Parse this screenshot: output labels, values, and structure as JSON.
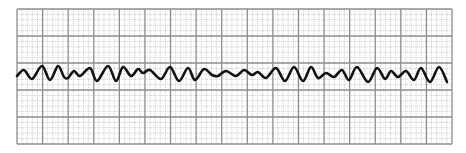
{
  "strip": {
    "type": "ecg-rhythm-strip",
    "background": "#ffffff",
    "grid": {
      "left": 17,
      "top": 9,
      "right": 452,
      "bottom": 144,
      "major_cols": 17,
      "major_rows": 5,
      "minor_per_major": 5,
      "major_color": "#8c8c8c",
      "minor_color": "#c8c8c8"
    },
    "trace": {
      "color": "#111111",
      "width": 2.6,
      "points": [
        [
          17,
          76
        ],
        [
          24,
          70
        ],
        [
          32,
          79
        ],
        [
          42,
          66
        ],
        [
          50,
          80
        ],
        [
          58,
          66
        ],
        [
          64,
          77
        ],
        [
          68,
          78
        ],
        [
          74,
          71
        ],
        [
          80,
          76
        ],
        [
          90,
          68
        ],
        [
          97,
          81
        ],
        [
          108,
          66
        ],
        [
          116,
          81
        ],
        [
          123,
          67
        ],
        [
          131,
          76
        ],
        [
          138,
          69
        ],
        [
          143,
          73
        ],
        [
          150,
          70
        ],
        [
          161,
          79
        ],
        [
          170,
          67
        ],
        [
          179,
          81
        ],
        [
          188,
          68
        ],
        [
          195,
          80
        ],
        [
          204,
          69
        ],
        [
          212,
          75
        ],
        [
          218,
          76
        ],
        [
          226,
          71
        ],
        [
          236,
          76
        ],
        [
          244,
          70
        ],
        [
          252,
          75
        ],
        [
          258,
          72
        ],
        [
          266,
          78
        ],
        [
          276,
          68
        ],
        [
          285,
          81
        ],
        [
          294,
          67
        ],
        [
          303,
          81
        ],
        [
          311,
          67
        ],
        [
          318,
          78
        ],
        [
          326,
          73
        ],
        [
          334,
          77
        ],
        [
          342,
          70
        ],
        [
          349,
          80
        ],
        [
          357,
          67
        ],
        [
          368,
          82
        ],
        [
          377,
          68
        ],
        [
          385,
          79
        ],
        [
          391,
          71
        ],
        [
          398,
          77
        ],
        [
          406,
          71
        ],
        [
          414,
          80
        ],
        [
          421,
          68
        ],
        [
          430,
          82
        ],
        [
          439,
          67
        ],
        [
          447,
          82
        ]
      ]
    }
  }
}
